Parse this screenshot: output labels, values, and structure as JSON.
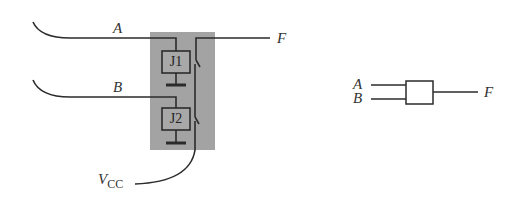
{
  "diagram": {
    "type": "relay-logic-circuit",
    "colors": {
      "wire": "#2b2b2b",
      "relay_panel": "#a3a3a3",
      "relay_box_fill": "#a8a8a8",
      "background": "#ffffff"
    },
    "relay_circuit": {
      "inputs": [
        {
          "id": "A",
          "label": "A"
        },
        {
          "id": "B",
          "label": "B"
        }
      ],
      "relays": [
        {
          "id": "J1",
          "label": "J1"
        },
        {
          "id": "J2",
          "label": "J2"
        }
      ],
      "output": {
        "label": "F"
      },
      "supply": {
        "label_main": "V",
        "label_sub": "CC"
      }
    },
    "logic_symbol": {
      "inputs": [
        "A",
        "B"
      ],
      "output": "F"
    }
  }
}
